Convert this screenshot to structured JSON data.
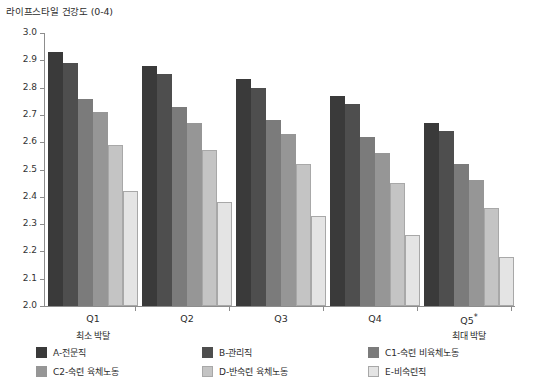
{
  "chart_data": {
    "type": "bar",
    "title": "라이프스타일 건강도 (0-4)",
    "xlabel": "",
    "ylabel": "",
    "ylim": [
      2.0,
      3.0
    ],
    "ytick_step": 0.1,
    "grid": false,
    "legend_position": "bottom",
    "categories": [
      "Q1",
      "Q2",
      "Q3",
      "Q4",
      "Q5*"
    ],
    "category_notes": {
      "first": "최소 박탈",
      "last": "최대 박탈"
    },
    "yticks": [
      "3.0",
      "2.9",
      "2.8",
      "2.7",
      "2.6",
      "2.5",
      "2.4",
      "2.3",
      "2.2",
      "2.1",
      "2.0"
    ],
    "series": [
      {
        "name": "A-전문직",
        "color": "#3a3a3a",
        "values": [
          2.93,
          2.88,
          2.83,
          2.77,
          2.67
        ]
      },
      {
        "name": "B-관리직",
        "color": "#4e4e4e",
        "values": [
          2.89,
          2.85,
          2.8,
          2.74,
          2.64
        ]
      },
      {
        "name": "C1-숙련 비육체노동",
        "color": "#7b7b7b",
        "values": [
          2.76,
          2.73,
          2.68,
          2.62,
          2.52
        ]
      },
      {
        "name": "C2-숙련 육체노동",
        "color": "#969696",
        "values": [
          2.71,
          2.67,
          2.63,
          2.56,
          2.46
        ]
      },
      {
        "name": "D-반숙련 육체노동",
        "color": "#c4c4c4",
        "values": [
          2.59,
          2.57,
          2.52,
          2.45,
          2.36
        ]
      },
      {
        "name": "E-비숙련직",
        "color": "#e4e4e4",
        "values": [
          2.42,
          2.38,
          2.33,
          2.26,
          2.18
        ]
      }
    ]
  },
  "footnote": "    "
}
